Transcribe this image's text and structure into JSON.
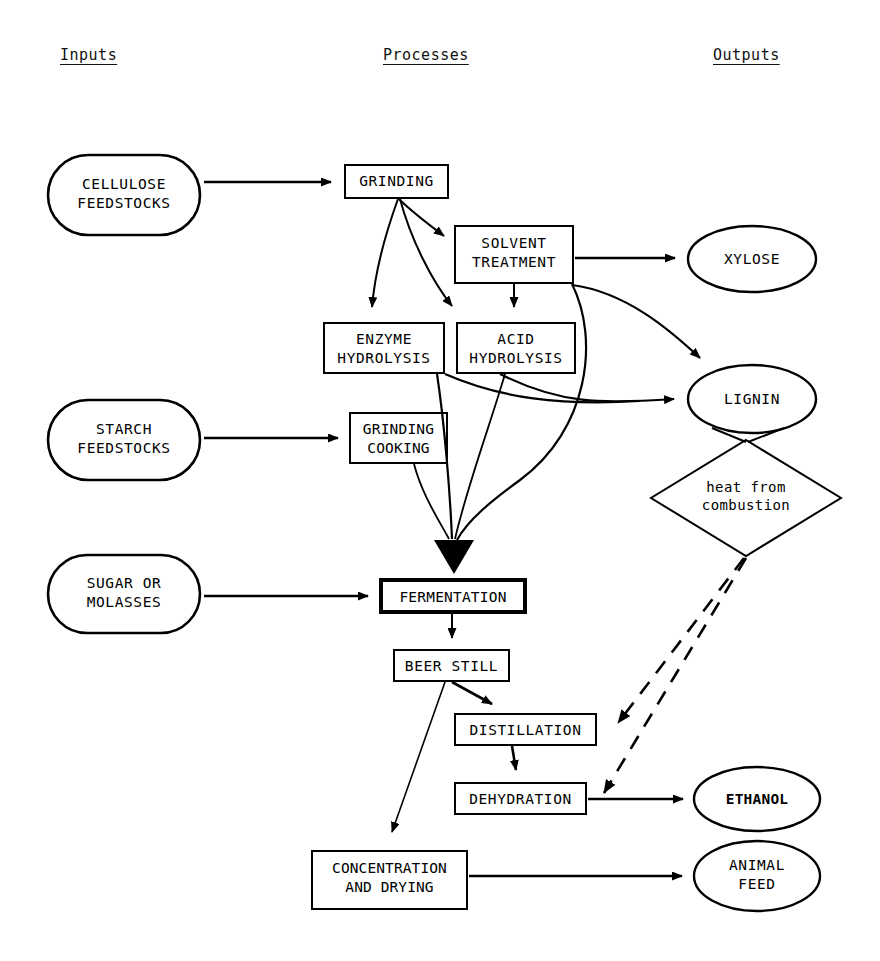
{
  "diagram": {
    "background_color": "#ffffff",
    "line_color": "#000000",
    "columns": [
      {
        "id": "inputs",
        "label": "Inputs",
        "x": 60,
        "y": 46
      },
      {
        "id": "processes",
        "label": "Processes",
        "x": 383,
        "y": 46
      },
      {
        "id": "outputs",
        "label": "Outputs",
        "x": 713,
        "y": 46
      }
    ],
    "nodes": [
      {
        "id": "cellulose_feedstocks",
        "label": "CELLULOSE\nFEEDSTOCKS",
        "shape": "stadium",
        "column": "inputs",
        "x": 48,
        "y": 155,
        "w": 152,
        "h": 80,
        "bold": false
      },
      {
        "id": "starch_feedstocks",
        "label": "STARCH\nFEEDSTOCKS",
        "shape": "stadium",
        "column": "inputs",
        "x": 48,
        "y": 400,
        "w": 152,
        "h": 80,
        "bold": false
      },
      {
        "id": "sugar_or_molasses",
        "label": "SUGAR OR\nMOLASSES",
        "shape": "stadium",
        "column": "inputs",
        "x": 48,
        "y": 555,
        "w": 152,
        "h": 78,
        "bold": false
      },
      {
        "id": "grinding",
        "label": "GRINDING",
        "shape": "rect",
        "column": "processes",
        "x": 345,
        "y": 165,
        "w": 103,
        "h": 33,
        "bold": false
      },
      {
        "id": "solvent_treatment",
        "label": "SOLVENT\nTREATMENT",
        "shape": "rect",
        "column": "processes",
        "x": 455,
        "y": 226,
        "w": 118,
        "h": 57,
        "bold": false
      },
      {
        "id": "enzyme_hydrolysis",
        "label": "ENZYME\nHYDROLYSIS",
        "shape": "rect",
        "column": "processes",
        "x": 324,
        "y": 323,
        "w": 120,
        "h": 50,
        "bold": false
      },
      {
        "id": "acid_hydrolysis",
        "label": "ACID\nHYDROLYSIS",
        "shape": "rect",
        "column": "processes",
        "x": 457,
        "y": 323,
        "w": 118,
        "h": 50,
        "bold": false
      },
      {
        "id": "grinding_cooking",
        "label": "GRINDING\nCOOKING",
        "shape": "rect",
        "column": "processes",
        "x": 350,
        "y": 413,
        "w": 97,
        "h": 50,
        "bold": false
      },
      {
        "id": "fermentation",
        "label": "FERMENTATION",
        "shape": "rect",
        "column": "processes",
        "x": 381,
        "y": 580,
        "w": 144,
        "h": 32,
        "bold": true
      },
      {
        "id": "beer_still",
        "label": "BEER STILL",
        "shape": "rect",
        "column": "processes",
        "x": 394,
        "y": 650,
        "w": 115,
        "h": 31,
        "bold": false
      },
      {
        "id": "distillation",
        "label": "DISTILLATION",
        "shape": "rect",
        "column": "processes",
        "x": 455,
        "y": 714,
        "w": 141,
        "h": 31,
        "bold": false
      },
      {
        "id": "dehydration",
        "label": "DEHYDRATION",
        "shape": "rect",
        "column": "processes",
        "x": 455,
        "y": 783,
        "w": 131,
        "h": 31,
        "bold": false
      },
      {
        "id": "concentration_drying",
        "label": "CONCENTRATION\nAND DRYING",
        "shape": "rect",
        "column": "processes",
        "x": 312,
        "y": 851,
        "w": 155,
        "h": 58,
        "bold": false
      },
      {
        "id": "xylose",
        "label": "XYLOSE",
        "shape": "ellipse",
        "column": "outputs",
        "x": 688,
        "y": 226,
        "w": 128,
        "h": 66,
        "bold": false
      },
      {
        "id": "lignin",
        "label": "LIGNIN",
        "shape": "ellipse",
        "column": "outputs",
        "x": 688,
        "y": 365,
        "w": 128,
        "h": 68,
        "bold": false
      },
      {
        "id": "heat_from_combustion",
        "label": "heat from\ncombustion",
        "shape": "diamond",
        "column": "outputs",
        "x": 651,
        "y": 440,
        "w": 190,
        "h": 116,
        "bold": false
      },
      {
        "id": "ethanol",
        "label": "ETHANOL",
        "shape": "ellipse",
        "column": "outputs",
        "x": 694,
        "y": 767,
        "w": 126,
        "h": 64,
        "bold": true
      },
      {
        "id": "animal_feed",
        "label": "ANIMAL\nFEED",
        "shape": "ellipse",
        "column": "outputs",
        "x": 694,
        "y": 841,
        "w": 126,
        "h": 70,
        "bold": false
      }
    ],
    "edges": [
      {
        "id": "cellulose_to_grinding",
        "from": "cellulose_feedstocks",
        "to": "grinding",
        "style": "solid",
        "arrow": "normal"
      },
      {
        "id": "starch_to_grinding_cooking",
        "from": "starch_feedstocks",
        "to": "grinding_cooking",
        "style": "solid",
        "arrow": "normal"
      },
      {
        "id": "sugar_to_fermentation",
        "from": "sugar_or_molasses",
        "to": "fermentation",
        "style": "solid",
        "arrow": "normal"
      },
      {
        "id": "grinding_to_solvent",
        "from": "grinding",
        "to": "solvent_treatment",
        "style": "solid",
        "arrow": "normal"
      },
      {
        "id": "grinding_to_enzyme",
        "from": "grinding",
        "to": "enzyme_hydrolysis",
        "style": "solid",
        "arrow": "normal"
      },
      {
        "id": "grinding_to_acid",
        "from": "grinding",
        "to": "acid_hydrolysis",
        "style": "solid",
        "arrow": "normal"
      },
      {
        "id": "solvent_to_acid",
        "from": "solvent_treatment",
        "to": "acid_hydrolysis",
        "style": "solid",
        "arrow": "normal"
      },
      {
        "id": "solvent_to_xylose",
        "from": "solvent_treatment",
        "to": "xylose",
        "style": "solid",
        "arrow": "normal"
      },
      {
        "id": "solvent_to_lignin",
        "from": "solvent_treatment",
        "to": "lignin",
        "style": "solid",
        "arrow": "normal"
      },
      {
        "id": "solvent_to_fermentation",
        "from": "solvent_treatment",
        "to": "fermentation",
        "style": "solid",
        "arrow": "merged"
      },
      {
        "id": "enzyme_to_lignin",
        "from": "enzyme_hydrolysis",
        "to": "lignin",
        "style": "solid",
        "arrow": "merged"
      },
      {
        "id": "acid_to_lignin",
        "from": "acid_hydrolysis",
        "to": "lignin",
        "style": "solid",
        "arrow": "merged"
      },
      {
        "id": "enzyme_to_fermentation",
        "from": "enzyme_hydrolysis",
        "to": "fermentation",
        "style": "solid",
        "arrow": "merged"
      },
      {
        "id": "acid_to_fermentation",
        "from": "acid_hydrolysis",
        "to": "fermentation",
        "style": "solid",
        "arrow": "merged"
      },
      {
        "id": "grinding_cooking_to_ferm",
        "from": "grinding_cooking",
        "to": "fermentation",
        "style": "solid",
        "arrow": "merged"
      },
      {
        "id": "lignin_to_heat",
        "from": "lignin",
        "to": "heat_from_combustion",
        "style": "solid",
        "arrow": "none"
      },
      {
        "id": "fermentation_to_beer_still",
        "from": "fermentation",
        "to": "beer_still",
        "style": "solid",
        "arrow": "normal"
      },
      {
        "id": "beer_still_to_distillation",
        "from": "beer_still",
        "to": "distillation",
        "style": "solid",
        "arrow": "normal"
      },
      {
        "id": "beer_still_to_concentration",
        "from": "beer_still",
        "to": "concentration_drying",
        "style": "solid",
        "arrow": "normal"
      },
      {
        "id": "distillation_to_dehydration",
        "from": "distillation",
        "to": "dehydration",
        "style": "solid",
        "arrow": "normal"
      },
      {
        "id": "dehydration_to_ethanol",
        "from": "dehydration",
        "to": "ethanol",
        "style": "solid",
        "arrow": "normal"
      },
      {
        "id": "concentration_to_feed",
        "from": "concentration_drying",
        "to": "animal_feed",
        "style": "solid",
        "arrow": "normal"
      },
      {
        "id": "heat_to_distillation",
        "from": "heat_from_combustion",
        "to": "distillation",
        "style": "dashed",
        "arrow": "normal"
      },
      {
        "id": "heat_to_dehydration",
        "from": "heat_from_combustion",
        "to": "dehydration",
        "style": "dashed",
        "arrow": "normal"
      }
    ]
  }
}
